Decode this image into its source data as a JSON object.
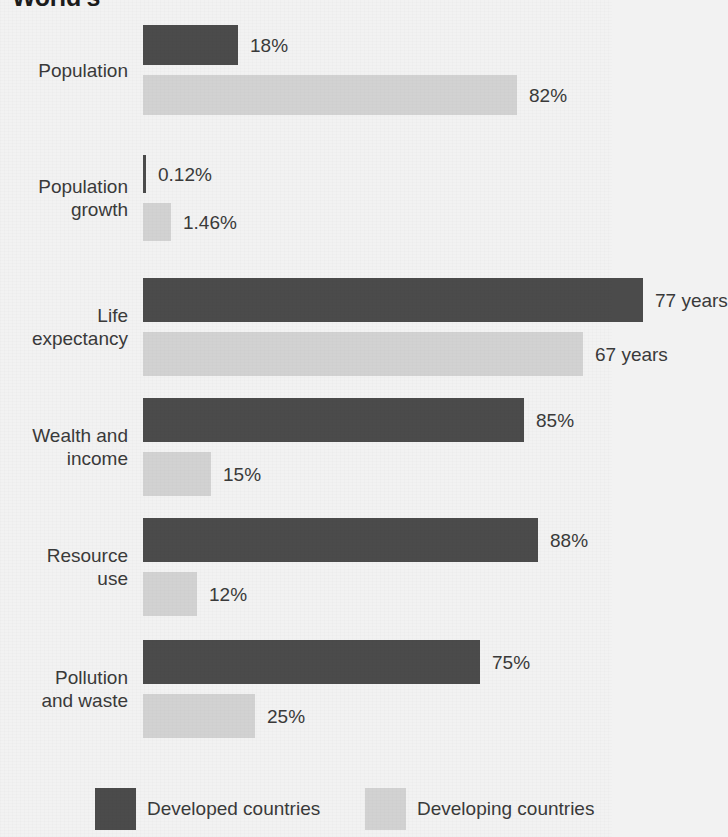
{
  "title_fragment": "World's",
  "colors": {
    "developed": "#4b4b4b",
    "developing": "#d2d2d2",
    "background": "#f2f2f2",
    "text": "#3a3a3a"
  },
  "legend": {
    "items": [
      {
        "label": "Developed countries",
        "swatch": "developed"
      },
      {
        "label": "Developing countries",
        "swatch": "developing"
      }
    ]
  },
  "chart_data": {
    "type": "bar",
    "orientation": "horizontal",
    "title": "World's",
    "xlabel": "",
    "ylabel": "",
    "grid": false,
    "legend_position": "bottom",
    "categories": [
      "Population",
      "Population growth",
      "Life expectancy",
      "Wealth and income",
      "Resource use",
      "Pollution and waste"
    ],
    "series": [
      {
        "name": "Developed countries",
        "values": [
          18,
          0.12,
          77,
          85,
          88,
          75
        ],
        "labels": [
          "18%",
          "0.12%",
          "77 years",
          "85%",
          "88%",
          "75%"
        ]
      },
      {
        "name": "Developing countries",
        "values": [
          82,
          1.46,
          67,
          15,
          12,
          25
        ],
        "labels": [
          "82%",
          "1.46%",
          "67 years",
          "15%",
          "12%",
          "25%"
        ]
      }
    ],
    "groups": [
      {
        "category": "Population",
        "label_lines": [
          "Population"
        ],
        "bars": [
          {
            "series": "Developed countries",
            "value": 18,
            "label": "18%",
            "unit": "%"
          },
          {
            "series": "Developing countries",
            "value": 82,
            "label": "82%",
            "unit": "%"
          }
        ]
      },
      {
        "category": "Population growth",
        "label_lines": [
          "Population",
          "growth"
        ],
        "bars": [
          {
            "series": "Developed countries",
            "value": 0.12,
            "label": "0.12%",
            "unit": "%"
          },
          {
            "series": "Developing countries",
            "value": 1.46,
            "label": "1.46%",
            "unit": "%"
          }
        ]
      },
      {
        "category": "Life expectancy",
        "label_lines": [
          "Life",
          "expectancy"
        ],
        "bars": [
          {
            "series": "Developed countries",
            "value": 77,
            "label": "77 years",
            "unit": "years"
          },
          {
            "series": "Developing countries",
            "value": 67,
            "label": "67 years",
            "unit": "years"
          }
        ]
      },
      {
        "category": "Wealth and income",
        "label_lines": [
          "Wealth and",
          "income"
        ],
        "bars": [
          {
            "series": "Developed countries",
            "value": 85,
            "label": "85%",
            "unit": "%"
          },
          {
            "series": "Developing countries",
            "value": 15,
            "label": "15%",
            "unit": "%"
          }
        ]
      },
      {
        "category": "Resource use",
        "label_lines": [
          "Resource",
          "use"
        ],
        "bars": [
          {
            "series": "Developed countries",
            "value": 88,
            "label": "88%",
            "unit": "%"
          },
          {
            "series": "Developing countries",
            "value": 12,
            "label": "12%",
            "unit": "%"
          }
        ]
      },
      {
        "category": "Pollution and waste",
        "label_lines": [
          "Pollution",
          "and waste"
        ],
        "bars": [
          {
            "series": "Developed countries",
            "value": 75,
            "label": "75%",
            "unit": "%"
          },
          {
            "series": "Developing countries",
            "value": 25,
            "label": "25%",
            "unit": "%"
          }
        ]
      }
    ]
  },
  "layout": {
    "bar_origin_x": 143,
    "group_tops": [
      25,
      155,
      278,
      398,
      518,
      640
    ],
    "bar_heights": [
      40,
      38,
      44,
      44,
      44,
      44
    ],
    "bar_pixel_widths": [
      [
        95,
        374
      ],
      [
        3,
        28
      ],
      [
        500,
        440
      ],
      [
        381,
        68
      ],
      [
        395,
        54
      ],
      [
        337,
        112
      ]
    ],
    "legend_x": [
      95,
      365
    ]
  }
}
